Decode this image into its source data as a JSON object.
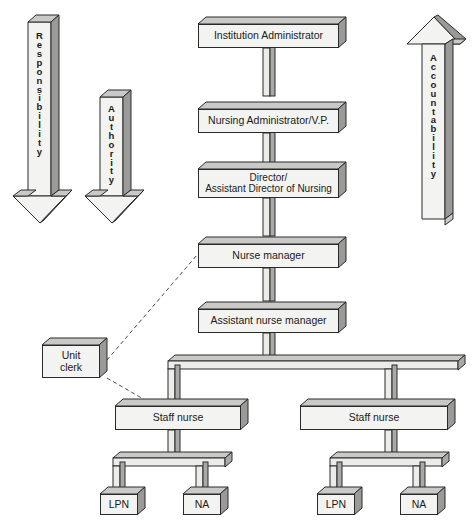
{
  "diagram": {
    "type": "organizational-hierarchy",
    "colors": {
      "box_face": "#f3f3f1",
      "box_top": "#c9c9c7",
      "box_side": "#9a9a98",
      "outline": "#2a2a2a",
      "connector_face": "#e8e8e6",
      "connector_shade": "#a8a8a6",
      "background": "#ffffff"
    }
  },
  "arrows": {
    "responsibility": {
      "label": "Responsibility",
      "letters": [
        "R",
        "e",
        "s",
        "p",
        "o",
        "n",
        "s",
        "i",
        "b",
        "i",
        "l",
        "i",
        "t",
        "y"
      ],
      "direction": "down"
    },
    "authority": {
      "label": "Authority",
      "letters": [
        "A",
        "u",
        "t",
        "h",
        "o",
        "r",
        "i",
        "t",
        "y"
      ],
      "direction": "down"
    },
    "accountability": {
      "label": "Accountability",
      "letters": [
        "A",
        "c",
        "c",
        "o",
        "u",
        "n",
        "t",
        "a",
        "b",
        "i",
        "l",
        "i",
        "t",
        "y"
      ],
      "direction": "up"
    }
  },
  "nodes": {
    "institution_administrator": {
      "label": "Institution Administrator"
    },
    "nursing_administrator": {
      "label": "Nursing Administrator/V.P."
    },
    "director": {
      "line1": "Director/",
      "line2": "Assistant Director of Nursing"
    },
    "nurse_manager": {
      "label": "Nurse manager"
    },
    "assistant_nurse_manager": {
      "label": "Assistant nurse manager"
    },
    "unit_clerk": {
      "line1": "Unit",
      "line2": "clerk"
    },
    "staff_nurse_left": {
      "label": "Staff nurse"
    },
    "staff_nurse_right": {
      "label": "Staff nurse"
    },
    "lpn_left": {
      "label": "LPN"
    },
    "na_left": {
      "label": "NA"
    },
    "lpn_right": {
      "label": "LPN"
    },
    "na_right": {
      "label": "NA"
    }
  },
  "caption": {
    "text": ""
  }
}
